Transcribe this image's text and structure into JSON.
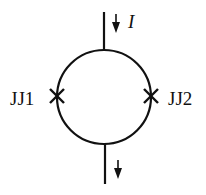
{
  "diagram": {
    "type": "dc-squid-circuit",
    "current_label": "I",
    "junctions": [
      {
        "label": "JJ1",
        "side": "left"
      },
      {
        "label": "JJ2",
        "side": "right"
      }
    ],
    "colors": {
      "stroke": "#111111",
      "background": "#ffffff"
    }
  }
}
